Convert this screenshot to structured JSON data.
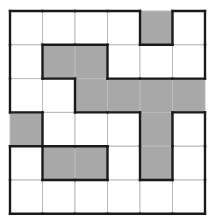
{
  "puzzle": {
    "rows": 6,
    "cols": 6,
    "origin": [
      10,
      11
    ],
    "cell_w": 32.5,
    "cell_h": 33.8,
    "colors": {
      "filled": "#a8a8a8",
      "empty": "#ffffff",
      "grid": "#bbbbbb",
      "outline": "#1a1a1a"
    },
    "grid": [
      [
        0,
        0,
        0,
        0,
        1,
        0
      ],
      [
        0,
        1,
        1,
        0,
        0,
        0
      ],
      [
        0,
        0,
        1,
        1,
        1,
        1
      ],
      [
        1,
        0,
        0,
        0,
        1,
        0
      ],
      [
        0,
        1,
        1,
        0,
        1,
        0
      ],
      [
        0,
        0,
        0,
        0,
        0,
        0
      ]
    ]
  }
}
